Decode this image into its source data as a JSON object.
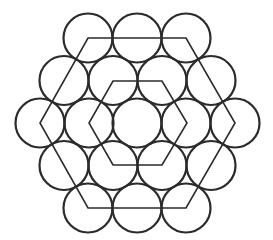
{
  "diagram": {
    "width": 273,
    "height": 240,
    "background": "#ffffff",
    "stroke_color": "#2b2b2b",
    "circle_stroke_width": 2.2,
    "line_stroke_width": 1.6,
    "circle_radius": 24.5,
    "circles": [
      {
        "cx": 88,
        "cy": 38
      },
      {
        "cx": 137,
        "cy": 38
      },
      {
        "cx": 186,
        "cy": 38
      },
      {
        "cx": 64,
        "cy": 80.5
      },
      {
        "cx": 113,
        "cy": 80.5
      },
      {
        "cx": 162,
        "cy": 80.5
      },
      {
        "cx": 211,
        "cy": 80.5
      },
      {
        "cx": 40,
        "cy": 123
      },
      {
        "cx": 89,
        "cy": 123
      },
      {
        "cx": 137,
        "cy": 123
      },
      {
        "cx": 186,
        "cy": 123
      },
      {
        "cx": 235,
        "cy": 123
      },
      {
        "cx": 64,
        "cy": 165.5
      },
      {
        "cx": 113,
        "cy": 165.5
      },
      {
        "cx": 162,
        "cy": 165.5
      },
      {
        "cx": 211,
        "cy": 165.5
      },
      {
        "cx": 88,
        "cy": 208
      },
      {
        "cx": 137,
        "cy": 208
      },
      {
        "cx": 186,
        "cy": 208
      }
    ],
    "outer_hexagon": [
      [
        88,
        38
      ],
      [
        186,
        38
      ],
      [
        235,
        123
      ],
      [
        186,
        208
      ],
      [
        88,
        208
      ],
      [
        40,
        123
      ]
    ],
    "inner_hexagon": [
      [
        113,
        81
      ],
      [
        162,
        81
      ],
      [
        187,
        123
      ],
      [
        162,
        165
      ],
      [
        113,
        165
      ],
      [
        89,
        123
      ]
    ]
  }
}
